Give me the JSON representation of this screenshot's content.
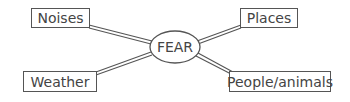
{
  "diagram": {
    "type": "spider-diagram",
    "center": {
      "label": "FEAR"
    },
    "branches": [
      {
        "label": "Noises",
        "position": "top-left"
      },
      {
        "label": "Places",
        "position": "top-right"
      },
      {
        "label": "Weather",
        "position": "bottom-left"
      },
      {
        "label": "People/animals",
        "position": "bottom-right"
      }
    ],
    "colors": {
      "line": "#555555",
      "text": "#444444",
      "background": "#ffffff"
    }
  }
}
